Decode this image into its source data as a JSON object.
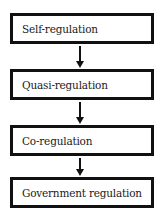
{
  "diagram": {
    "type": "flowchart",
    "direction": "top-to-bottom",
    "nodes": [
      {
        "id": "n1",
        "label": "Self-regulation"
      },
      {
        "id": "n2",
        "label": "Quasi-regulation"
      },
      {
        "id": "n3",
        "label": "Co-regulation"
      },
      {
        "id": "n4",
        "label": "Government regulation"
      }
    ],
    "edges": [
      {
        "from": "n1",
        "to": "n2"
      },
      {
        "from": "n2",
        "to": "n3"
      },
      {
        "from": "n3",
        "to": "n4"
      }
    ],
    "colors": {
      "border": "#111111",
      "background": "#ffffff",
      "text": "#1a1a1a"
    }
  }
}
